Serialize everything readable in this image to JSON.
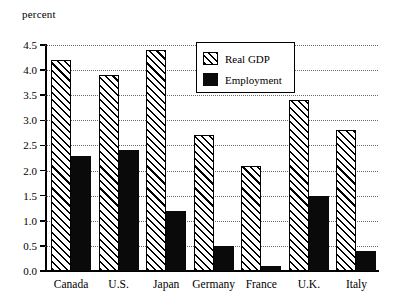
{
  "chart_data": {
    "type": "bar",
    "title": "",
    "subtitle": "",
    "unit_caption": "percent",
    "xlabel": "",
    "ylabel": "percent",
    "ylim": [
      0.0,
      4.5
    ],
    "ytick_step": 0.5,
    "ytick_labels": [
      "4.5",
      "4.0",
      "3.5",
      "3.0",
      "2.5",
      "2.0",
      "1.5",
      "1.0",
      "0.5",
      "0.0"
    ],
    "ytick_values": [
      4.5,
      4.0,
      3.5,
      3.0,
      2.5,
      2.0,
      1.5,
      1.0,
      0.5,
      0.0
    ],
    "grid": true,
    "grid_axis": "y",
    "grid_style": "dotted",
    "legend_position": "top-center",
    "categories": [
      "Canada",
      "U.S.",
      "Japan",
      "Germany",
      "France",
      "U.K.",
      "Italy"
    ],
    "series": [
      {
        "name": "Real GDP",
        "fill": "diagonal-hatch",
        "color": "#000000",
        "values": [
          4.2,
          3.9,
          4.4,
          2.7,
          2.1,
          3.4,
          2.8
        ]
      },
      {
        "name": "Employment",
        "fill": "solid",
        "color": "#0a0a0a",
        "values": [
          2.3,
          2.4,
          1.2,
          0.5,
          0.1,
          1.5,
          0.4
        ]
      }
    ]
  },
  "legend": {
    "items": [
      {
        "label": "Real GDP"
      },
      {
        "label": "Employment"
      }
    ]
  }
}
